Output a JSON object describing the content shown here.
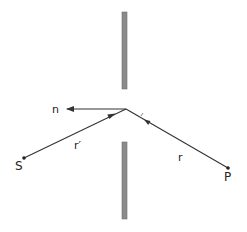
{
  "diagram": {
    "type": "aperture-diffraction-geometry",
    "colors": {
      "line": "#333333",
      "barrier": "#8a8a8a",
      "barrier_edge": "#6e6e6e",
      "background": "#ffffff"
    },
    "barriers": [
      {
        "name": "upper-screen",
        "x": 122,
        "y1": 12,
        "y2": 89,
        "width": 5
      },
      {
        "name": "lower-screen",
        "x": 122,
        "y1": 142,
        "y2": 219,
        "width": 5
      }
    ],
    "aperture_point": {
      "x": 126,
      "y": 109
    },
    "points": [
      {
        "name": "S",
        "label": "S",
        "x": 24,
        "y": 158,
        "label_x": 15,
        "label_y": 170
      },
      {
        "name": "P",
        "label": "P",
        "x": 228,
        "y": 168,
        "label_x": 224,
        "label_y": 181
      }
    ],
    "vectors": [
      {
        "name": "n",
        "label": "n",
        "from": [
          126,
          109
        ],
        "to": [
          66,
          109
        ],
        "label_x": 52,
        "label_y": 113
      },
      {
        "name": "r-prime",
        "label": "r′",
        "from": [
          24,
          158
        ],
        "to": [
          126,
          109
        ],
        "label_x": 74,
        "label_y": 149
      },
      {
        "name": "r",
        "label": "r",
        "from": [
          228,
          168
        ],
        "to": [
          126,
          109
        ],
        "label_x": 178,
        "label_y": 161
      }
    ]
  }
}
